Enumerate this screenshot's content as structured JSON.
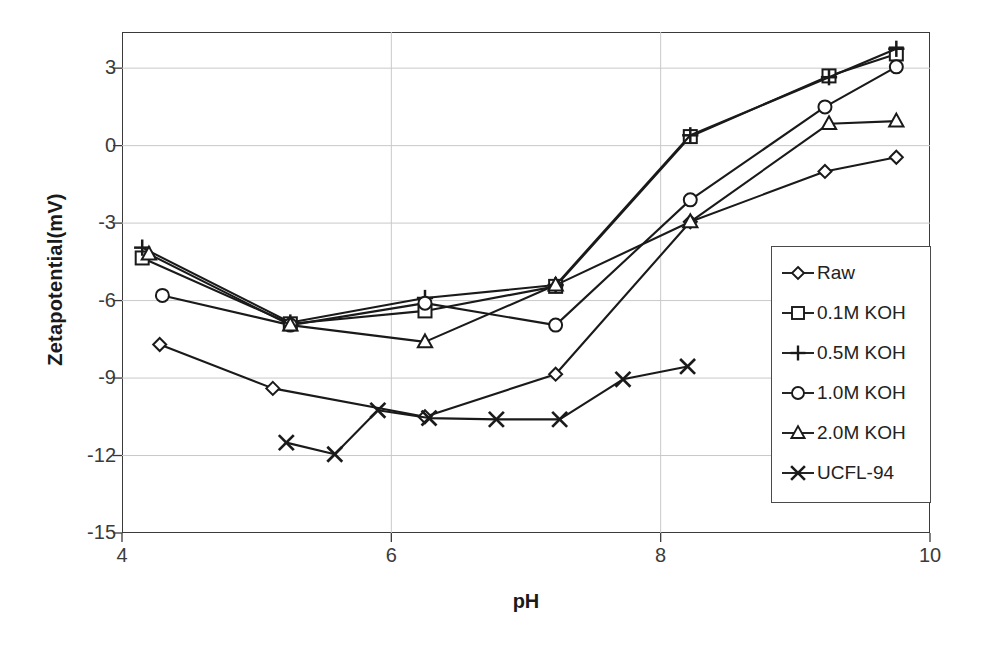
{
  "chart_data": {
    "type": "line",
    "title": "",
    "xlabel": "pH",
    "ylabel": "Zetapotential(mV)",
    "xlim": [
      4,
      10
    ],
    "ylim": [
      -15,
      4.4
    ],
    "xticks": [
      4,
      6,
      8,
      10
    ],
    "yticks": [
      3,
      0,
      -3,
      -6,
      -9,
      -12,
      -15
    ],
    "grid": true,
    "legend_position": "inside-right",
    "series": [
      {
        "name": "Raw",
        "marker": "diamond",
        "x": [
          4.28,
          5.12,
          6.25,
          7.22,
          8.22,
          9.22,
          9.75
        ],
        "y": [
          -7.7,
          -9.4,
          -10.5,
          -8.85,
          -2.95,
          -1.0,
          -0.45
        ]
      },
      {
        "name": "0.1M KOH",
        "marker": "square",
        "x": [
          4.15,
          5.25,
          6.25,
          7.22,
          8.22,
          9.25,
          9.75
        ],
        "y": [
          -4.35,
          -6.9,
          -6.4,
          -5.45,
          0.35,
          2.7,
          3.55
        ]
      },
      {
        "name": "0.5M KOH",
        "marker": "plus",
        "x": [
          4.15,
          5.25,
          6.25,
          7.22,
          8.22,
          9.25,
          9.75
        ],
        "y": [
          -3.95,
          -6.85,
          -5.9,
          -5.4,
          0.4,
          2.65,
          3.75
        ]
      },
      {
        "name": "1.0M KOH",
        "marker": "circle",
        "x": [
          4.3,
          5.25,
          6.25,
          7.22,
          8.22,
          9.22,
          9.75
        ],
        "y": [
          -5.8,
          -6.95,
          -6.1,
          -6.95,
          -2.1,
          1.5,
          3.05
        ]
      },
      {
        "name": "2.0M KOH",
        "marker": "triangle",
        "x": [
          4.2,
          5.25,
          6.25,
          7.22,
          8.22,
          9.25,
          9.75
        ],
        "y": [
          -4.2,
          -6.95,
          -7.6,
          -5.4,
          -2.95,
          0.85,
          0.95
        ]
      },
      {
        "name": "UCFL-94",
        "marker": "cross",
        "x": [
          5.22,
          5.58,
          5.9,
          6.28,
          6.78,
          7.25,
          7.72,
          8.2
        ],
        "y": [
          -11.5,
          -11.95,
          -10.25,
          -10.55,
          -10.6,
          -10.6,
          -9.05,
          -8.55
        ]
      }
    ]
  },
  "legend": {
    "items": [
      {
        "label": "Raw",
        "marker": "diamond"
      },
      {
        "label": "0.1M KOH",
        "marker": "square"
      },
      {
        "label": "0.5M KOH",
        "marker": "plus"
      },
      {
        "label": "1.0M KOH",
        "marker": "circle"
      },
      {
        "label": "2.0M KOH",
        "marker": "triangle"
      },
      {
        "label": "UCFL-94",
        "marker": "cross"
      }
    ]
  },
  "colors": {
    "line": "#1a1a1a",
    "grid": "#c9c9c9",
    "frame": "#3a3a3a",
    "text": "#3b3b3b",
    "background": "#ffffff"
  }
}
